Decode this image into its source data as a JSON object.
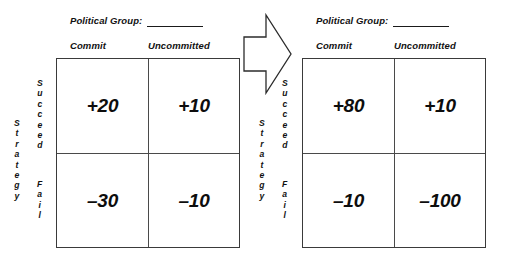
{
  "diagram": {
    "title_hidden": "",
    "arrow": {
      "name": "transformation-arrow",
      "direction": "right"
    },
    "panels": [
      {
        "id": "before",
        "header_label": "Political Group:",
        "header_blank": "",
        "column_headers": [
          "Commit",
          "Uncommitted"
        ],
        "row_axis_label": "Strategy",
        "row_headers": [
          "Succeed",
          "Fail"
        ],
        "cells": [
          [
            "+20",
            "+10"
          ],
          [
            "–30",
            "–10"
          ]
        ]
      },
      {
        "id": "after",
        "header_label": "Political Group:",
        "header_blank": "",
        "column_headers": [
          "Commit",
          "Uncommitted"
        ],
        "row_axis_label": "Strategy",
        "row_headers": [
          "Succeed",
          "Fail"
        ],
        "cells": [
          [
            "+80",
            "+10"
          ],
          [
            "–10",
            "–100"
          ]
        ]
      }
    ],
    "colors": {
      "background": "#ffffff",
      "text": "#111111",
      "grid_outer": "#3a3a3a",
      "grid_inner": "#4a4a4a",
      "arrow_stroke": "#2b2b2b",
      "arrow_fill": "#ffffff"
    }
  }
}
